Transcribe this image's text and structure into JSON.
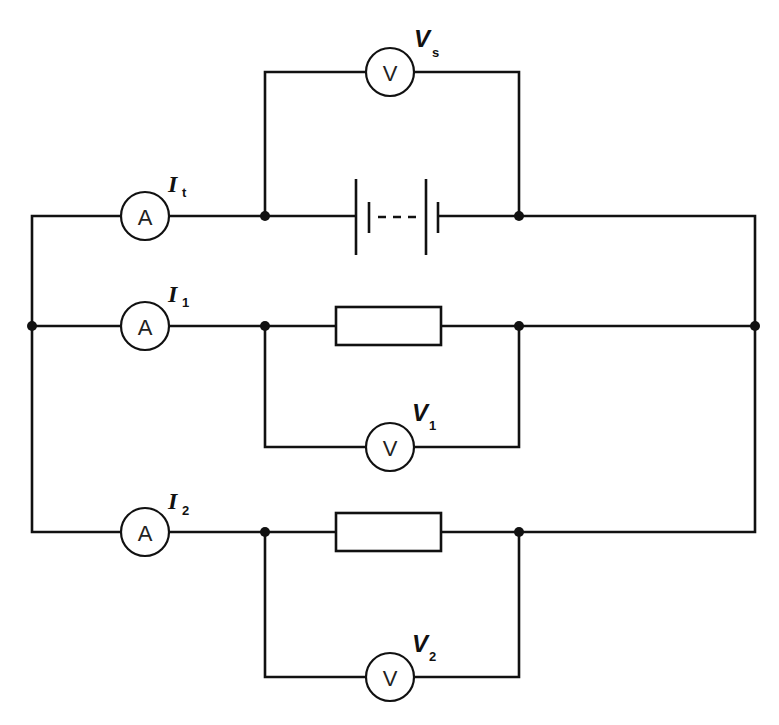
{
  "diagram": {
    "colors": {
      "line": "#111111",
      "background": "#ffffff"
    },
    "meters": {
      "ammeter_symbol": "A",
      "voltmeter_symbol": "V"
    },
    "labels": {
      "vs": {
        "main": "V",
        "sub": "s"
      },
      "it": {
        "main": "I",
        "sub": "t"
      },
      "i1": {
        "main": "I",
        "sub": "1"
      },
      "v1": {
        "main": "V",
        "sub": "1"
      },
      "i2": {
        "main": "I",
        "sub": "2"
      },
      "v2": {
        "main": "V",
        "sub": "2"
      }
    },
    "components": [
      {
        "id": "ammeter-total",
        "type": "ammeter",
        "label": "It"
      },
      {
        "id": "battery",
        "type": "battery",
        "cells": "multiple (dashed)"
      },
      {
        "id": "voltmeter-supply",
        "type": "voltmeter",
        "label": "Vs"
      },
      {
        "id": "ammeter-1",
        "type": "ammeter",
        "label": "I1"
      },
      {
        "id": "resistor-1",
        "type": "resistor"
      },
      {
        "id": "voltmeter-1",
        "type": "voltmeter",
        "label": "V1"
      },
      {
        "id": "ammeter-2",
        "type": "ammeter",
        "label": "I2"
      },
      {
        "id": "resistor-2",
        "type": "resistor"
      },
      {
        "id": "voltmeter-2",
        "type": "voltmeter",
        "label": "V2"
      }
    ]
  }
}
